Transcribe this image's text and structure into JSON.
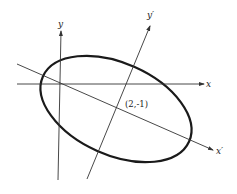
{
  "diagram": {
    "colors": {
      "line": "#333333",
      "ellipse": "#1a1a1a",
      "background": "#ffffff"
    },
    "axes": {
      "x": {
        "label": "x",
        "from": [
          17,
          84
        ],
        "to": [
          204,
          84
        ]
      },
      "y": {
        "label": "y",
        "from": [
          58,
          180
        ],
        "to": [
          61,
          31
        ]
      },
      "x_prime": {
        "label": "x′",
        "from": [
          17,
          64
        ],
        "to": [
          213,
          150
        ]
      },
      "y_prime": {
        "label": "y′",
        "from": [
          87,
          179
        ],
        "to": [
          150,
          26
        ]
      }
    },
    "ellipse": {
      "cx": 116,
      "cy": 109,
      "rx": 80,
      "ry": 46,
      "rotation_deg": 24
    },
    "center_point": {
      "label": "(2,-1)"
    }
  }
}
